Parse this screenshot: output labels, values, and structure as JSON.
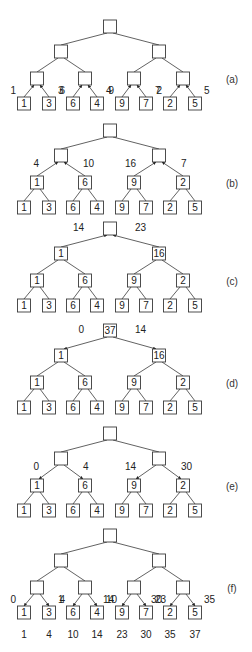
{
  "figure": {
    "leaf_values": [
      "1",
      "3",
      "6",
      "4",
      "9",
      "7",
      "2",
      "5"
    ],
    "panels": [
      {
        "label": "(a)",
        "root": "",
        "level1": [
          "",
          ""
        ],
        "level2": [
          "",
          "",
          "",
          ""
        ],
        "arrows": "leaves-to-level2-up",
        "edge_labels": {
          "leaf_edges": [
            "1",
            "3",
            "6",
            "4",
            "9",
            "7",
            "2",
            "5"
          ]
        }
      },
      {
        "label": "(b)",
        "root": "",
        "level1": [
          "",
          ""
        ],
        "level2": [
          "1",
          "6",
          "9",
          "2"
        ],
        "arrows": "level2-to-level1-up",
        "edge_labels": {
          "level2_edges": [
            "4",
            "10",
            "16",
            "7"
          ]
        }
      },
      {
        "label": "(c)",
        "root": "",
        "level1": [
          "1",
          "16"
        ],
        "level2": [
          "1",
          "6",
          "9",
          "2"
        ],
        "arrows": "level1-to-root-up",
        "edge_labels": {
          "level1_edges": [
            "14",
            "23"
          ]
        }
      },
      {
        "label": "(d)",
        "root": "37",
        "level1": [
          "1",
          "16"
        ],
        "level2": [
          "1",
          "6",
          "9",
          "2"
        ],
        "arrows": "root-to-level1-down",
        "edge_labels": {
          "level1_edges": [
            "0",
            "14"
          ]
        }
      },
      {
        "label": "(e)",
        "root": "",
        "level1": [
          "",
          ""
        ],
        "level2": [
          "1",
          "6",
          "9",
          "2"
        ],
        "arrows": "level1-to-level2-down",
        "edge_labels": {
          "level2_edges": [
            "0",
            "4",
            "14",
            "30"
          ]
        }
      },
      {
        "label": "(f)",
        "root": "",
        "level1": [
          "",
          ""
        ],
        "level2": [
          "",
          "",
          "",
          ""
        ],
        "arrows": "level2-to-leaves-down",
        "edge_labels": {
          "leaf_edges": [
            "0",
            "1",
            "4",
            "10",
            "14",
            "23",
            "30",
            "35"
          ]
        }
      }
    ],
    "prefix_sums": [
      "1",
      "4",
      "10",
      "14",
      "23",
      "30",
      "35",
      "37"
    ]
  }
}
